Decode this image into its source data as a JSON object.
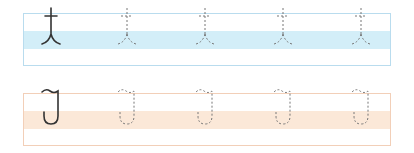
{
  "worksheet": {
    "rows": [
      {
        "name": "row-1",
        "band_color": "#d3eef8",
        "border_color": "#b9dcee",
        "model_glyph": "solid-stroke-character",
        "trace_count": 4
      },
      {
        "name": "row-2",
        "band_color": "#fbe8d8",
        "border_color": "#f2cfb8",
        "model_glyph": "solid-stroke-character",
        "trace_count": 4
      }
    ],
    "colors": {
      "ink": "#333333",
      "trace": "#777777"
    }
  }
}
